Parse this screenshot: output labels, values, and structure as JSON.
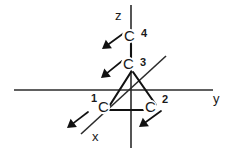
{
  "figure": {
    "background_color": "#ffffff",
    "ink_color": "#111111"
  },
  "axes": [
    {
      "name": "x-axis",
      "label": "x",
      "label_x": 92,
      "label_y": 141,
      "orientation": "diagonal",
      "from_x": 166,
      "from_y": 56,
      "to_x": 81,
      "to_y": 134
    },
    {
      "name": "y-axis",
      "label": "y",
      "label_x": 213,
      "label_y": 103,
      "orientation": "horizontal",
      "from_x": 14,
      "from_y": 90,
      "to_x": 213,
      "to_y": 90
    },
    {
      "name": "z-axis",
      "label": "z",
      "label_x": 115,
      "label_y": 20,
      "orientation": "vertical",
      "from_x": 131,
      "from_y": 5,
      "to_x": 131,
      "to_y": 148
    }
  ],
  "atoms": [
    {
      "name": "atom-c1",
      "symbol": "C",
      "index": "1",
      "symbol_x": 98,
      "symbol_y": 112,
      "index_x": 91,
      "index_y": 102
    },
    {
      "name": "atom-c2",
      "symbol": "C",
      "index": "2",
      "symbol_x": 145,
      "symbol_y": 112,
      "index_x": 162,
      "index_y": 103
    },
    {
      "name": "atom-c3",
      "symbol": "C",
      "index": "3",
      "symbol_x": 123,
      "symbol_y": 69,
      "index_x": 140,
      "index_y": 66
    },
    {
      "name": "atom-c4",
      "symbol": "C",
      "index": "4",
      "symbol_x": 124,
      "symbol_y": 41,
      "index_x": 141,
      "index_y": 37
    }
  ],
  "bonds": [
    {
      "name": "bond-c3-c1",
      "from_x": 131,
      "from_y": 72,
      "to_x": 110,
      "to_y": 105
    },
    {
      "name": "bond-c3-c2",
      "from_x": 133,
      "from_y": 72,
      "to_x": 156,
      "to_y": 105
    },
    {
      "name": "bond-c1-c2",
      "from_x": 110,
      "from_y": 110,
      "to_x": 146,
      "to_y": 110
    },
    {
      "name": "bond-c4-c3",
      "from_x": 131,
      "from_y": 44,
      "to_x": 131,
      "to_y": 58
    }
  ],
  "pointers": [
    {
      "name": "pointer-to-c4",
      "tail_x": 124,
      "tail_y": 33,
      "tip_x": 102,
      "tip_y": 49
    },
    {
      "name": "pointer-to-c3",
      "tail_x": 122,
      "tail_y": 61,
      "tip_x": 101,
      "tip_y": 78
    },
    {
      "name": "pointer-to-c1",
      "tail_x": 88,
      "tail_y": 112,
      "tip_x": 67,
      "tip_y": 128
    },
    {
      "name": "pointer-to-c2",
      "tail_x": 161,
      "tail_y": 111,
      "tip_x": 139,
      "tip_y": 127
    }
  ]
}
